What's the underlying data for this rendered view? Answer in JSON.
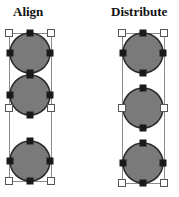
{
  "titles": {
    "align": "Align",
    "distribute": "Distribute"
  },
  "colors": {
    "circle_fill": "#7a7a7a",
    "circle_stroke": "#2a2a2a",
    "handle_black": "#1a1a1a",
    "handle_white": "#ffffff",
    "box_stroke": "#8a8a8a"
  },
  "panels": [
    {
      "name": "align",
      "box": {
        "x": 9,
        "y": 33,
        "w": 42,
        "h": 148
      },
      "circles": [
        {
          "cx": 30,
          "cy": 53,
          "r": 20
        },
        {
          "cx": 30,
          "cy": 95,
          "r": 20
        },
        {
          "cx": 30,
          "cy": 161,
          "r": 20
        }
      ],
      "white_handles": [
        [
          9,
          33
        ],
        [
          51,
          33
        ],
        [
          9,
          108
        ],
        [
          51,
          108
        ],
        [
          9,
          181
        ],
        [
          51,
          181
        ]
      ]
    },
    {
      "name": "distribute",
      "box": {
        "x": 122,
        "y": 33,
        "w": 42,
        "h": 150
      },
      "circles": [
        {
          "cx": 143,
          "cy": 53,
          "r": 20
        },
        {
          "cx": 143,
          "cy": 108,
          "r": 20
        },
        {
          "cx": 143,
          "cy": 163,
          "r": 20
        }
      ],
      "white_handles": [
        [
          122,
          33
        ],
        [
          164,
          33
        ],
        [
          122,
          108
        ],
        [
          164,
          108
        ],
        [
          122,
          183
        ],
        [
          164,
          183
        ]
      ]
    }
  ]
}
